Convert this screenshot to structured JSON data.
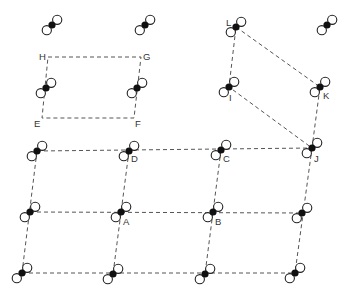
{
  "diagram": {
    "colors": {
      "line": "#555555",
      "atom_solid": "#111111",
      "atom_open": "#ffffff",
      "label": "#333333"
    },
    "molecules": [
      {
        "x": 52,
        "y": 25
      },
      {
        "x": 145,
        "y": 25
      },
      {
        "x": 236,
        "y": 27
      },
      {
        "x": 327,
        "y": 25
      },
      {
        "x": 46,
        "y": 88
      },
      {
        "x": 137,
        "y": 88
      },
      {
        "x": 229,
        "y": 87
      },
      {
        "x": 320,
        "y": 87
      },
      {
        "x": 37,
        "y": 151
      },
      {
        "x": 129,
        "y": 151
      },
      {
        "x": 221,
        "y": 150
      },
      {
        "x": 312,
        "y": 148
      },
      {
        "x": 30,
        "y": 212
      },
      {
        "x": 121,
        "y": 212
      },
      {
        "x": 213,
        "y": 212
      },
      {
        "x": 302,
        "y": 213
      },
      {
        "x": 22,
        "y": 273
      },
      {
        "x": 113,
        "y": 274
      },
      {
        "x": 205,
        "y": 274
      },
      {
        "x": 295,
        "y": 273
      }
    ],
    "cells": [
      {
        "name": "EFGH",
        "points": [
          [
            48,
            57
          ],
          [
            141,
            57
          ],
          [
            134,
            118
          ],
          [
            42,
            118
          ]
        ]
      },
      {
        "name": "IJKL",
        "points": [
          [
            236,
            27
          ],
          [
            320,
            87
          ],
          [
            312,
            148
          ],
          [
            229,
            87
          ]
        ]
      },
      {
        "name": "grid-h1",
        "points": [
          [
            37,
            151
          ],
          [
            312,
            148
          ]
        ],
        "open": true
      },
      {
        "name": "grid-h2",
        "points": [
          [
            30,
            212
          ],
          [
            302,
            213
          ]
        ],
        "open": true
      },
      {
        "name": "grid-h3",
        "points": [
          [
            22,
            273
          ],
          [
            295,
            273
          ]
        ],
        "open": true
      },
      {
        "name": "grid-v1",
        "points": [
          [
            37,
            151
          ],
          [
            22,
            273
          ]
        ],
        "open": true
      },
      {
        "name": "grid-v2",
        "points": [
          [
            129,
            151
          ],
          [
            113,
            274
          ]
        ],
        "open": true
      },
      {
        "name": "grid-v3",
        "points": [
          [
            221,
            150
          ],
          [
            205,
            274
          ]
        ],
        "open": true
      },
      {
        "name": "grid-v4",
        "points": [
          [
            312,
            148
          ],
          [
            295,
            273
          ]
        ],
        "open": true
      }
    ],
    "labels": [
      {
        "text": "H",
        "x": 39,
        "y": 60
      },
      {
        "text": "G",
        "x": 143,
        "y": 60
      },
      {
        "text": "E",
        "x": 34,
        "y": 127
      },
      {
        "text": "F",
        "x": 135,
        "y": 127
      },
      {
        "text": "L",
        "x": 226,
        "y": 26
      },
      {
        "text": "I",
        "x": 229,
        "y": 101
      },
      {
        "text": "K",
        "x": 323,
        "y": 99
      },
      {
        "text": "J",
        "x": 314,
        "y": 162
      },
      {
        "text": "D",
        "x": 131,
        "y": 162
      },
      {
        "text": "C",
        "x": 223,
        "y": 162
      },
      {
        "text": "A",
        "x": 123,
        "y": 225
      },
      {
        "text": "B",
        "x": 215,
        "y": 225
      }
    ]
  }
}
